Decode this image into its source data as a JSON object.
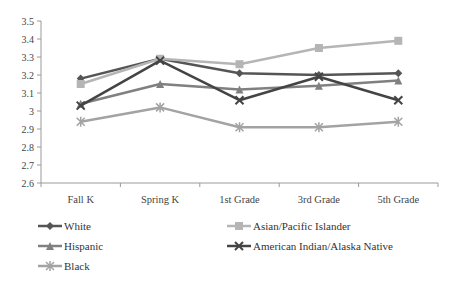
{
  "chart_data": {
    "type": "line",
    "title": "",
    "xlabel": "",
    "ylabel": "",
    "categories": [
      "Fall K",
      "Spring K",
      "1st Grade",
      "3rd Grade",
      "5th Grade"
    ],
    "ylim": [
      2.6,
      3.5
    ],
    "yticks": [
      "3.5",
      "3.4",
      "3.3",
      "3.2",
      "3.1",
      "3",
      "2.9",
      "2.8",
      "2.7",
      "2.6"
    ],
    "grid": false,
    "legend_position": "bottom",
    "series": [
      {
        "name": "White",
        "marker": "diamond",
        "color": "#555555",
        "values": [
          3.18,
          3.29,
          3.21,
          3.2,
          3.21
        ]
      },
      {
        "name": "Asian/Pacific Islander",
        "marker": "square",
        "color": "#b5b5b5",
        "values": [
          3.15,
          3.29,
          3.26,
          3.35,
          3.39
        ]
      },
      {
        "name": "Hispanic",
        "marker": "triangle",
        "color": "#808080",
        "values": [
          3.04,
          3.15,
          3.12,
          3.14,
          3.17
        ]
      },
      {
        "name": "American Indian/Alaska Native",
        "marker": "x",
        "color": "#444444",
        "values": [
          3.03,
          3.28,
          3.06,
          3.19,
          3.06
        ]
      },
      {
        "name": "Black",
        "marker": "star",
        "color": "#a3a3a3",
        "values": [
          2.94,
          3.02,
          2.91,
          2.91,
          2.94
        ]
      }
    ]
  },
  "legend": {
    "items": [
      {
        "label": "White"
      },
      {
        "label": "Asian/Pacific Islander"
      },
      {
        "label": "Hispanic"
      },
      {
        "label": "American Indian/Alaska Native"
      },
      {
        "label": "Black"
      }
    ]
  }
}
